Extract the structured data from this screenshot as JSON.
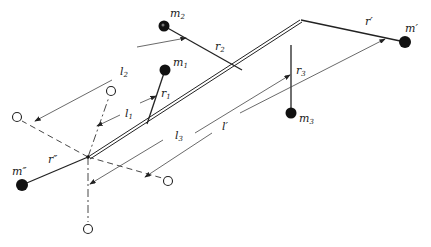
{
  "diagram": {
    "labels": {
      "m1": "m",
      "m1_sub": "1",
      "m2": "m",
      "m2_sub": "2",
      "m3": "m",
      "m3_sub": "3",
      "m_prime": "m′",
      "m_double_prime": "m″",
      "r1": "r",
      "r1_sub": "1",
      "r2": "r",
      "r2_sub": "2",
      "r3": "r",
      "r3_sub": "3",
      "r_prime": "r′",
      "r_double_prime": "r″",
      "l1": "l",
      "l1_sub": "1",
      "l2": "l",
      "l2_sub": "2",
      "l3": "l",
      "l3_sub": "3",
      "l_prime": "l′"
    },
    "colors": {
      "ink": "#222222",
      "background": "#ffffff"
    }
  }
}
